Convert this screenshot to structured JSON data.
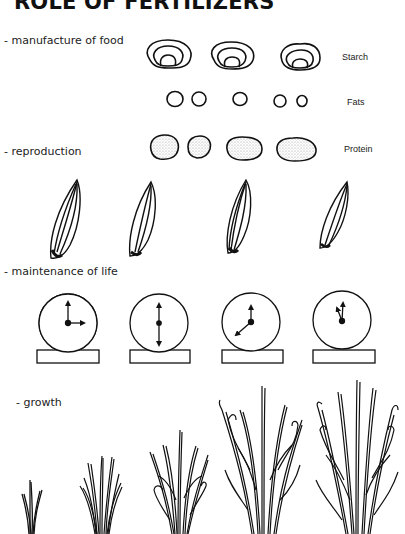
{
  "title": "ROLE OF FERTILIZERS",
  "sections": [
    {
      "id": "food",
      "label": "- manufacture of food"
    },
    {
      "id": "reproduction",
      "label": "- reproduction"
    },
    {
      "id": "maintenance",
      "label": "- maintenance of life"
    },
    {
      "id": "growth",
      "label": "- growth"
    }
  ],
  "nutrients": [
    {
      "label": "Starch",
      "icon": "starch-granule-icon",
      "count": 3
    },
    {
      "label": "Fats",
      "icon": "fat-droplet-icon",
      "count": 5
    },
    {
      "label": "Protein",
      "icon": "protein-body-icon",
      "count": 4
    }
  ],
  "seeds": {
    "icon": "grain-seed-icon",
    "count": 4
  },
  "clocks": [
    {
      "time": "3:00"
    },
    {
      "time": "6:00"
    },
    {
      "time": "8:00"
    },
    {
      "time": "11:55"
    }
  ],
  "plants": {
    "icon": "grass-plant-icon",
    "count": 5,
    "stages": [
      "seedling",
      "young",
      "tillering",
      "mature",
      "full"
    ]
  },
  "colors": {
    "ink": "#111111",
    "background": "#ffffff",
    "stipple": "#d9d9d9"
  }
}
